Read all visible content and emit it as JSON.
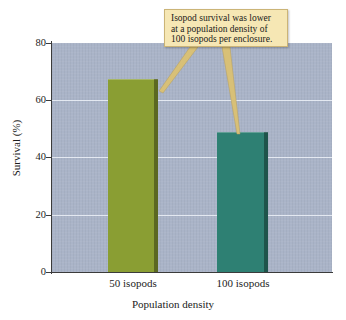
{
  "chart_data": {
    "type": "bar",
    "title": "",
    "xlabel": "Population density",
    "ylabel": "Survival (%)",
    "categories": [
      "50 isopods",
      "100 isopods"
    ],
    "values": [
      67.5,
      49
    ],
    "ylim": [
      0,
      80
    ],
    "yticks": [
      "0",
      "20",
      "40",
      "60",
      "80"
    ],
    "ytick_values": [
      0,
      20,
      40,
      60,
      80
    ],
    "grid": true,
    "legend": "none",
    "bar_colors": [
      "#8a9e33",
      "#2e8073"
    ],
    "plot_background": "#aab4c8",
    "annotations": [
      {
        "text": "Isopod survival was lower at a population density of 100 isopods per enclosure.",
        "lines": [
          "Isopod survival was lower",
          "at a population density of",
          "100 isopods per enclosure."
        ],
        "box_color": "#f6e7b4",
        "border_color": "#cbb477",
        "pointer_color": "#d8c077",
        "points_to": [
          "50 isopods",
          "100 isopods"
        ]
      }
    ]
  },
  "axes": {
    "y_title": "Survival (%)",
    "x_title": "Population density",
    "y_ticks": [
      "80",
      "60",
      "40",
      "20",
      "0"
    ],
    "x_ticks": [
      "50 isopods",
      "100 isopods"
    ]
  },
  "callout": {
    "line1": "Isopod survival was lower",
    "line2": "at a population density of",
    "line3": "100 isopods per enclosure."
  }
}
